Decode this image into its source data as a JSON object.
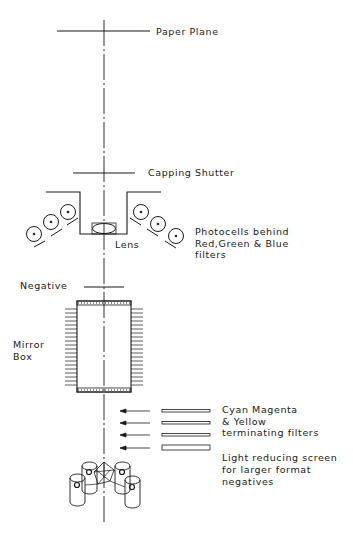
{
  "diagram": {
    "colors": {
      "ink": "#1a1a1a",
      "background": "#ffffff"
    },
    "labels": {
      "paper_plane": "Paper Plane",
      "capping_shutter": "Capping Shutter",
      "lens": "Lens",
      "photocells": [
        "Photocells behind",
        "Red,Green & Blue",
        "filters"
      ],
      "negative": "Negative",
      "mirror_box": [
        "Mirror",
        "Box"
      ],
      "filters": [
        "Cyan Magenta",
        "& Yellow",
        "terminating filters"
      ],
      "screen": [
        "Light reducing screen",
        "for larger format",
        "negatives"
      ]
    },
    "components": [
      "paper-plane",
      "capping-shutter",
      "lens",
      "photocells-red-green-blue",
      "negative",
      "mirror-box",
      "cyan-magenta-yellow-terminating-filters",
      "light-reducing-screen",
      "lamp-assembly"
    ]
  }
}
